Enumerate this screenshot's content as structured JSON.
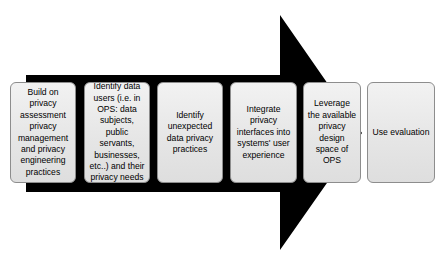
{
  "diagram": {
    "arrow": {
      "name": "process-arrow",
      "color": "#000000",
      "direction": "right"
    },
    "background_color": "#ffffff",
    "box_fill_color": "#ebebeb",
    "box_border_color": "#8d8d8d",
    "text_color": "#000000",
    "steps": [
      {
        "id": "step-1",
        "order": 1,
        "text": "Build on privacy assessment privacy management and privacy engineering practices"
      },
      {
        "id": "step-2",
        "order": 2,
        "text": "Identify data users (i.e. in OPS: data subjects, public servants, businesses, etc..) and their privacy needs"
      },
      {
        "id": "step-3",
        "order": 3,
        "text": "Identify unexpected data privacy practices"
      },
      {
        "id": "step-4",
        "order": 4,
        "text": "Integrate privacy interfaces into systems' user experience"
      },
      {
        "id": "step-5",
        "order": 5,
        "text": "Leverage the available privacy design space of OPS"
      },
      {
        "id": "step-6",
        "order": 6,
        "text": "Use evaluation"
      }
    ]
  }
}
